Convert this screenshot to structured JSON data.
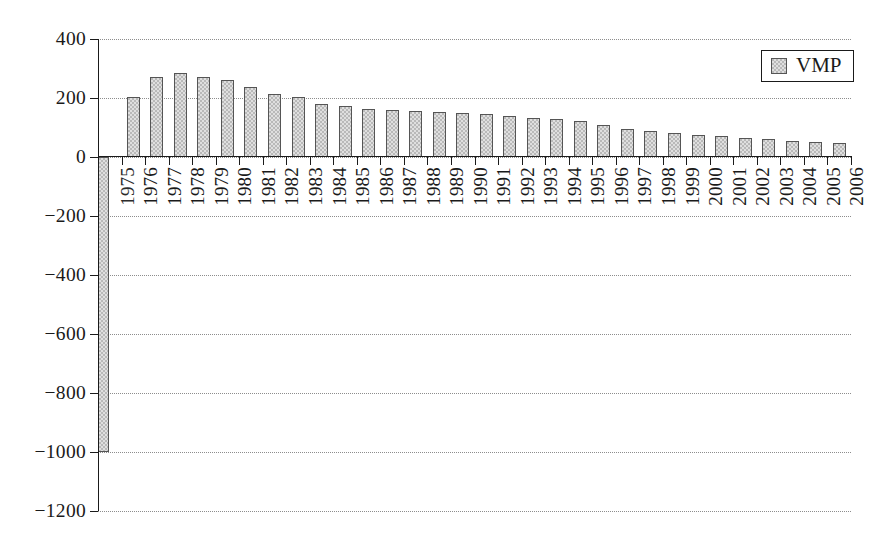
{
  "chart_data": {
    "type": "bar",
    "title": "",
    "subtitle": "",
    "xlabel": "",
    "ylabel": "",
    "ylim": [
      -1200,
      400
    ],
    "yticks": [
      400,
      200,
      0,
      -200,
      -400,
      -600,
      -800,
      -1000,
      -1200
    ],
    "ytick_labels": [
      "400",
      "200",
      "0",
      "−200",
      "−400",
      "−600",
      "−800",
      "−1000",
      "−1200"
    ],
    "grid": true,
    "grid_axis": "y",
    "grid_style": "dotted",
    "legend": {
      "position": "top-right",
      "entries": [
        {
          "name": "VMP",
          "color": "#b9b9b9",
          "edge_color": "#555555",
          "pattern": "checkerboard"
        }
      ]
    },
    "categories": [
      "1975",
      "1976",
      "1977",
      "1978",
      "1979",
      "1980",
      "1981",
      "1982",
      "1983",
      "1984",
      "1985",
      "1986",
      "1987",
      "1988",
      "1989",
      "1990",
      "1991",
      "1992",
      "1993",
      "1994",
      "1995",
      "1996",
      "1997",
      "1998",
      "1999",
      "2000",
      "2001",
      "2002",
      "2003",
      "2004",
      "2005",
      "2006"
    ],
    "series": [
      {
        "name": "VMP",
        "values": [
          -1000,
          205,
          270,
          285,
          270,
          260,
          237,
          212,
          202,
          180,
          172,
          163,
          158,
          155,
          152,
          148,
          145,
          140,
          133,
          128,
          122,
          110,
          95,
          88,
          82,
          76,
          72,
          66,
          61,
          55,
          50,
          48
        ]
      }
    ]
  },
  "colors": {
    "bar_fill": "#b9b9b9",
    "bar_edge": "#555555",
    "axis": "#1a1a1a",
    "gridline": "#8d8d8d",
    "background": "#ffffff",
    "text": "#1a1a1a"
  }
}
